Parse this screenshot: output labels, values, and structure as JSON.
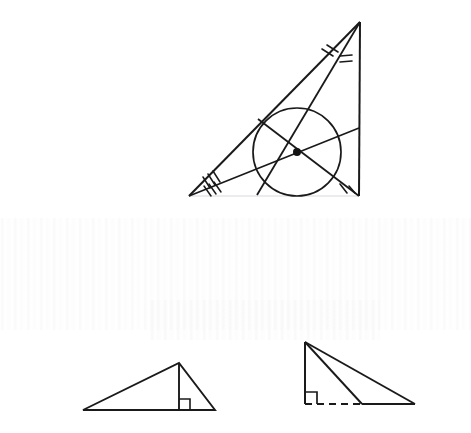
{
  "document": {
    "title": "Geometry worksheet scan — triangle incenter and altitudes",
    "background_color": "#ffffff",
    "ink_color": "#1a1a1a",
    "faint_ink_color": "#e8e8ea",
    "width": 471,
    "height": 433
  },
  "figures": [
    {
      "id": "figure-1",
      "name": "triangle-with-incircle-and-angle-bisectors",
      "caption_text": "",
      "elements": {
        "triangle": {
          "name": "main-triangle",
          "vertices": [
            {
              "label": "apex",
              "x": 360,
              "y": 22
            },
            {
              "label": "bottom-left",
              "x": 189,
              "y": 196
            },
            {
              "label": "bottom-right",
              "x": 359,
              "y": 196
            }
          ],
          "edge_styles": [
            "solid",
            "solid",
            "faded"
          ]
        },
        "incircle": {
          "name": "incircle",
          "center": {
            "x": 297,
            "y": 152
          },
          "radius": 44
        },
        "incenter": {
          "name": "incenter-point",
          "x": 297,
          "y": 152,
          "dot_radius": 4
        },
        "bisectors": [
          {
            "name": "bisector-from-apex",
            "from": {
              "x": 360,
              "y": 22
            },
            "to": {
              "x": 257,
              "y": 195
            }
          },
          {
            "name": "bisector-from-bottom-left",
            "from": {
              "x": 189,
              "y": 196
            },
            "to": {
              "x": 359,
              "y": 128
            }
          },
          {
            "name": "bisector-from-bottom-right",
            "from": {
              "x": 359,
              "y": 196
            },
            "to": {
              "x": 258,
              "y": 119
            }
          }
        ],
        "angle_marks": [
          {
            "name": "angle-tick-apex-left",
            "count": 2
          },
          {
            "name": "angle-tick-apex-right",
            "count": 2
          },
          {
            "name": "angle-tick-bottom-left-upper",
            "count": 3
          },
          {
            "name": "angle-tick-bottom-left-lower",
            "count": 3
          },
          {
            "name": "angle-tick-bottom-right-left",
            "count": 1
          },
          {
            "name": "angle-tick-bottom-right-right",
            "count": 1
          }
        ]
      }
    },
    {
      "id": "figure-2",
      "name": "acute-triangle-with-interior-altitude",
      "elements": {
        "triangle": {
          "name": "triangle-left",
          "vertices": [
            {
              "label": "left",
              "x": 83,
              "y": 410
            },
            {
              "label": "apex",
              "x": 179,
              "y": 363
            },
            {
              "label": "right",
              "x": 215,
              "y": 410
            }
          ]
        },
        "altitude": {
          "name": "altitude-segment",
          "from": {
            "x": 179,
            "y": 363
          },
          "to": {
            "x": 179,
            "y": 410
          },
          "style": "solid"
        },
        "right_angle_mark": {
          "name": "right-angle-marker",
          "corner": {
            "x": 179,
            "y": 410
          },
          "size": 11,
          "opens": "right"
        }
      }
    },
    {
      "id": "figure-3",
      "name": "right-triangle-with-exterior-altitude",
      "elements": {
        "triangle": {
          "name": "triangle-right",
          "vertices": [
            {
              "label": "apex",
              "x": 305,
              "y": 342
            },
            {
              "label": "foot",
              "x": 362,
              "y": 404
            },
            {
              "label": "right",
              "x": 415,
              "y": 404
            }
          ]
        },
        "vertical_leg": {
          "name": "vertical-leg",
          "from": {
            "x": 305,
            "y": 342
          },
          "to": {
            "x": 305,
            "y": 404
          },
          "style": "solid"
        },
        "base_extension": {
          "name": "dashed-base-extension",
          "from": {
            "x": 305,
            "y": 404
          },
          "to": {
            "x": 362,
            "y": 404
          },
          "style": "dashed"
        },
        "right_angle_mark": {
          "name": "right-angle-marker",
          "corner": {
            "x": 305,
            "y": 404
          },
          "size": 12,
          "opens": "right"
        }
      }
    }
  ],
  "artifacts": {
    "name": "scanner-streak-band",
    "description": "faint vertical scanner streaks across middle of page"
  }
}
